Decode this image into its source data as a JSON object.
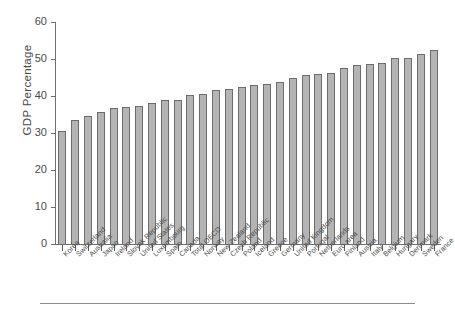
{
  "chart_data": {
    "type": "bar",
    "title": "",
    "xlabel": "",
    "ylabel": "GDP Percentage",
    "ylim": [
      0,
      60
    ],
    "yticks": [
      0,
      10,
      20,
      30,
      40,
      50,
      60
    ],
    "grid": false,
    "legend": null,
    "orientation": "vertical",
    "bar_color": "#b4b4b4",
    "bar_edge_color": "#6d6d6d",
    "axis_color": "#6f6f6f",
    "categories": [
      "Korea",
      "Switzerland",
      "Australia",
      "Japan",
      "Ireland",
      "Slovak Republic",
      "United States",
      "Luxembourg",
      "Spain",
      "Canada",
      "Total OECD",
      "Norway",
      "New Zealand",
      "Czech Republic",
      "Poland",
      "Iceland",
      "Greece",
      "Germany",
      "United Kingdom",
      "Portugal",
      "Netherlands",
      "Euro area",
      "Finland",
      "Austria",
      "Italy",
      "Belgium",
      "Hungary",
      "Denmark",
      "Sweden",
      "France"
    ],
    "values": [
      30.6,
      33.4,
      34.5,
      35.7,
      36.7,
      36.9,
      37.4,
      38.1,
      38.8,
      39.0,
      40.4,
      40.6,
      41.7,
      41.9,
      42.4,
      43.1,
      43.3,
      43.8,
      44.8,
      45.8,
      46.0,
      46.2,
      47.7,
      48.3,
      48.6,
      48.9,
      50.2,
      50.4,
      51.4,
      52.5
    ]
  },
  "figure": {
    "y_axis_title": "GDP Percentage"
  }
}
